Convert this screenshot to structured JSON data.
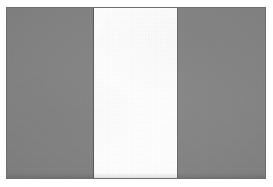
{
  "image": {
    "subject": "flag",
    "description": "Grayscale scan of a vertical tricolour flag",
    "orientation": "horizontal",
    "width_px": 273,
    "height_px": 187
  },
  "plate": {
    "border_color": "#6f6f6f",
    "background_color": "#ffffff",
    "left_px": 6,
    "top_px": 7,
    "width_px": 260,
    "height_px": 172
  },
  "flag": {
    "layout": "three-vertical-bands",
    "bands": [
      {
        "name": "hoist-band",
        "position": "left",
        "color": "#838383",
        "width_percent": 33.6,
        "seam_color": "#5a5a5a"
      },
      {
        "name": "middle-band",
        "position": "center",
        "color": "#fefefe",
        "width_percent": 32.2,
        "seam_color": "#6a6a6a"
      },
      {
        "name": "fly-band",
        "position": "right",
        "color": "#858585",
        "width_percent": 34.2,
        "seam_color": "#6a6a6a"
      }
    ]
  },
  "page": {
    "margin_color": "#ffffff"
  }
}
